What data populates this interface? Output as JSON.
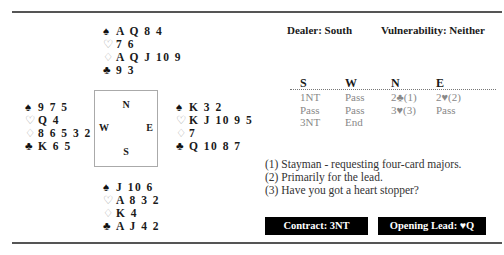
{
  "hands": {
    "north": [
      {
        "suit": "spades",
        "glyph": "♠",
        "style": "black",
        "cards": "A Q 8 4"
      },
      {
        "suit": "hearts",
        "glyph": "♡",
        "style": "outline",
        "cards": "7 6"
      },
      {
        "suit": "diamonds",
        "glyph": "♢",
        "style": "outline",
        "cards": "A Q J 10 9"
      },
      {
        "suit": "clubs",
        "glyph": "♣",
        "style": "black",
        "cards": "9 3"
      }
    ],
    "west": [
      {
        "suit": "spades",
        "glyph": "♠",
        "style": "black",
        "cards": "9 7 5"
      },
      {
        "suit": "hearts",
        "glyph": "♡",
        "style": "outline",
        "cards": "Q 4"
      },
      {
        "suit": "diamonds",
        "glyph": "♢",
        "style": "outline",
        "cards": "8 6 5 3 2"
      },
      {
        "suit": "clubs",
        "glyph": "♣",
        "style": "black",
        "cards": "K 6 5"
      }
    ],
    "east": [
      {
        "suit": "spades",
        "glyph": "♠",
        "style": "black",
        "cards": "K 3 2"
      },
      {
        "suit": "hearts",
        "glyph": "♡",
        "style": "outline",
        "cards": "K J 10 9 5"
      },
      {
        "suit": "diamonds",
        "glyph": "♢",
        "style": "outline",
        "cards": "7"
      },
      {
        "suit": "clubs",
        "glyph": "♣",
        "style": "black",
        "cards": "Q 10 8 7"
      }
    ],
    "south": [
      {
        "suit": "spades",
        "glyph": "♠",
        "style": "black",
        "cards": "J 10 6"
      },
      {
        "suit": "hearts",
        "glyph": "♡",
        "style": "outline",
        "cards": "A 8 3 2"
      },
      {
        "suit": "diamonds",
        "glyph": "♢",
        "style": "outline",
        "cards": "K 4"
      },
      {
        "suit": "clubs",
        "glyph": "♣",
        "style": "black",
        "cards": "A J 4 2"
      }
    ]
  },
  "compass": {
    "north": "N",
    "south": "S",
    "west": "W",
    "east": "E"
  },
  "meta": {
    "dealer": "Dealer: South",
    "vulnerability": "Vulnerability: Neither"
  },
  "bidding": {
    "headers": [
      "S",
      "W",
      "N",
      "E"
    ],
    "rows": [
      [
        "1NT",
        "Pass",
        "2♣(1)",
        "2♥(2)"
      ],
      [
        "Pass",
        "Pass",
        "3♥(3)",
        "Pass"
      ],
      [
        "3NT",
        "End",
        "",
        ""
      ]
    ]
  },
  "notes": [
    "(1) Stayman - requesting four-card majors.",
    "(2) Primarily for the lead.",
    "(3) Have you got a heart stopper?"
  ],
  "footer": {
    "contract": "Contract: 3NT",
    "opening_lead": "Opening Lead: ♥Q"
  },
  "colors": {
    "label_bg": "#000000",
    "label_text": "#ffffff",
    "rule": "#555555",
    "bid_text": "#888888"
  }
}
